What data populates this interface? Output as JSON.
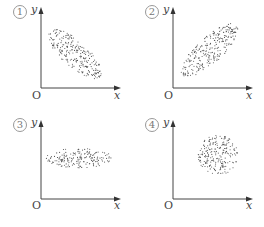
{
  "chart_data": [
    {
      "type": "scatter",
      "label": "①",
      "description": "Negative correlation: elongated ellipse sloping downward",
      "xlabel": "x",
      "ylabel": "y",
      "origin": "O",
      "ellipse": {
        "cx": 75,
        "cy": 54,
        "rx": 34,
        "ry": 13,
        "angle": 42
      }
    },
    {
      "type": "scatter",
      "label": "②",
      "description": "Positive correlation: elongated ellipse sloping upward",
      "xlabel": "x",
      "ylabel": "y",
      "origin": "O",
      "ellipse": {
        "cx": 78,
        "cy": 50,
        "rx": 37,
        "ry": 13,
        "angle": -42
      }
    },
    {
      "type": "scatter",
      "label": "③",
      "description": "No correlation: horizontal elongated ellipse",
      "xlabel": "x",
      "ylabel": "y",
      "origin": "O",
      "ellipse": {
        "cx": 79,
        "cy": 45,
        "rx": 33,
        "ry": 10,
        "angle": 0
      }
    },
    {
      "type": "scatter",
      "label": "④",
      "description": "No correlation: circular cloud",
      "xlabel": "x",
      "ylabel": "y",
      "origin": "O",
      "ellipse": {
        "cx": 86,
        "cy": 42,
        "rx": 20,
        "ry": 20,
        "angle": 0
      }
    }
  ],
  "panels": [
    {
      "num": "1",
      "x": "x",
      "y": "y",
      "o": "O"
    },
    {
      "num": "2",
      "x": "x",
      "y": "y",
      "o": "O"
    },
    {
      "num": "3",
      "x": "x",
      "y": "y",
      "o": "O"
    },
    {
      "num": "4",
      "x": "x",
      "y": "y",
      "o": "O"
    }
  ]
}
